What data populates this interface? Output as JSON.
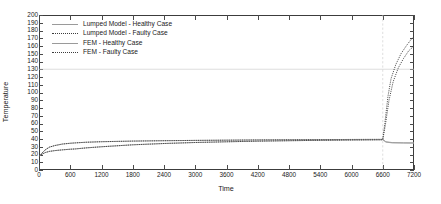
{
  "chart_data": {
    "type": "line",
    "title": "",
    "xlabel": "Time",
    "ylabel": "Temperature",
    "xlim": [
      0,
      7200
    ],
    "ylim": [
      0,
      200
    ],
    "xticks": [
      0,
      600,
      1200,
      1800,
      2400,
      3000,
      3600,
      4200,
      4800,
      5400,
      6000,
      6600,
      7200
    ],
    "yticks": [
      0,
      10,
      20,
      30,
      40,
      50,
      60,
      70,
      80,
      90,
      100,
      110,
      120,
      130,
      140,
      150,
      160,
      170,
      180,
      190,
      200
    ],
    "grid": "horizontal gridline at y=130; vertical gridline at x=6600",
    "gridlines": {
      "horizontal": [
        130
      ],
      "vertical": [
        6600
      ]
    },
    "legend_position": "upper left inside axes",
    "series": [
      {
        "name": "Lumped Model - Healthy Case",
        "style": "solid",
        "color": "#9a9a9a",
        "x": [
          0,
          60,
          120,
          200,
          300,
          450,
          600,
          700,
          900,
          1200,
          1800,
          2400,
          3000,
          3600,
          4200,
          4800,
          5400,
          6000,
          6600,
          6660,
          6780,
          7000,
          7200
        ],
        "y": [
          18,
          22,
          26,
          29.5,
          31.5,
          33.5,
          34.5,
          35,
          35.8,
          36.5,
          37.3,
          37.8,
          38.2,
          38.5,
          38.8,
          39,
          39.2,
          39.4,
          39.5,
          36.5,
          35.4,
          35.1,
          35
        ]
      },
      {
        "name": "Lumped Model - Faulty Case",
        "style": "dotted",
        "color": "#3c3c3c",
        "x": [
          0,
          60,
          120,
          200,
          300,
          450,
          600,
          700,
          900,
          1200,
          1800,
          2400,
          3000,
          3600,
          4200,
          4800,
          5400,
          6000,
          6600,
          6640,
          6700,
          6760,
          6850,
          6950,
          7050,
          7150,
          7200
        ],
        "y": [
          18,
          22,
          26,
          29.5,
          31.5,
          33.5,
          34.5,
          35,
          35.8,
          36.5,
          37.3,
          37.8,
          38.2,
          38.5,
          38.8,
          39,
          39.2,
          39.4,
          39.5,
          60,
          95,
          118,
          136,
          150,
          160,
          169,
          172
        ]
      },
      {
        "name": "FEM - Healthy Case",
        "style": "solid",
        "color": "#9a9a9a",
        "x": [
          0,
          60,
          120,
          200,
          300,
          450,
          600,
          700,
          900,
          1200,
          1800,
          2400,
          3000,
          3600,
          4200,
          4800,
          5400,
          6000,
          6600,
          6660,
          6780,
          7000,
          7200
        ],
        "y": [
          18,
          20.5,
          22.5,
          24,
          25,
          26,
          26.8,
          27.2,
          28.5,
          30,
          32.5,
          34.2,
          35.5,
          36.4,
          37.2,
          37.8,
          38.3,
          38.7,
          39,
          36,
          35,
          34.8,
          34.7
        ]
      },
      {
        "name": "FEM - Faulty Case",
        "style": "dotted",
        "color": "#3c3c3c",
        "x": [
          0,
          60,
          120,
          200,
          300,
          450,
          600,
          700,
          900,
          1200,
          1800,
          2400,
          3000,
          3600,
          4200,
          4800,
          5400,
          6000,
          6600,
          6650,
          6720,
          6800,
          6900,
          7000,
          7100,
          7200
        ],
        "y": [
          18,
          20.5,
          22.5,
          24,
          25,
          26,
          26.8,
          27.2,
          28.5,
          30,
          32.5,
          34.2,
          35.5,
          36.4,
          37.2,
          37.8,
          38.3,
          38.7,
          39,
          58,
          90,
          114,
          132,
          144,
          154,
          160
        ]
      }
    ]
  }
}
